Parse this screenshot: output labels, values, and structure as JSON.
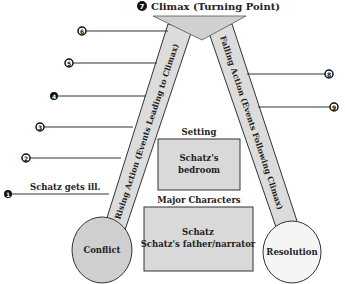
{
  "diagram": {
    "title_number": "7",
    "title": "Climax (Turning Point)",
    "rising_action_label": "Rising Action (Events Leading to Climax)",
    "falling_action_label": "Falling Action (Events Following Climax)",
    "conflict_label": "Conflict",
    "resolution_label": "Resolution",
    "setting": {
      "heading": "Setting",
      "line1": "Schatz's",
      "line2": "bedroom"
    },
    "characters": {
      "heading": "Major Characters",
      "line1": "Schatz",
      "line2": "Schatz's father/narrator"
    },
    "rising_events": [
      {
        "number": "1",
        "text": "Schatz gets ill."
      },
      {
        "number": "2",
        "text": ""
      },
      {
        "number": "3",
        "text": ""
      },
      {
        "number": "4",
        "text": ""
      },
      {
        "number": "5",
        "text": ""
      },
      {
        "number": "6",
        "text": ""
      }
    ],
    "falling_events": [
      {
        "number": "8",
        "text": ""
      },
      {
        "number": "9",
        "text": ""
      }
    ],
    "colors": {
      "fill_gray": "#d9d9d9",
      "circle_conflict": "#cfcfcf",
      "circle_resolution": "#f2f2f2",
      "line": "#333333"
    }
  }
}
